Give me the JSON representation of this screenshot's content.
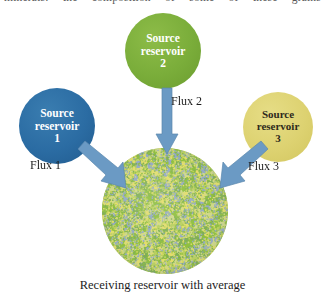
{
  "page": {
    "top_running_text": "minerals: the composition of some of these grains",
    "caption": "Receiving reservoir with average"
  },
  "reservoirs": [
    {
      "id": "source-reservoir-1",
      "line1": "Source",
      "line2": "reservoir",
      "line3": "1",
      "color": "#2b6ca3"
    },
    {
      "id": "source-reservoir-2",
      "line1": "Source",
      "line2": "reservoir",
      "line3": "2",
      "color": "#7aad3a"
    },
    {
      "id": "source-reservoir-3",
      "line1": "Source",
      "line2": "reservoir",
      "line3": "3",
      "color": "#ddd271"
    }
  ],
  "fluxes": [
    {
      "id": "flux-1",
      "label": "Flux 1",
      "direction": "down-right"
    },
    {
      "id": "flux-2",
      "label": "Flux 2",
      "direction": "down"
    },
    {
      "id": "flux-3",
      "label": "Flux 3",
      "direction": "down-left"
    }
  ],
  "receiving_reservoir": {
    "name": "receiving-reservoir",
    "speckle_colors": [
      "#8fbf3f",
      "#e2dd6a",
      "#93a9c4",
      "#b8cf5e",
      "#cfd88a",
      "#7fae56"
    ],
    "arrow_color": "#6b9ac4"
  }
}
